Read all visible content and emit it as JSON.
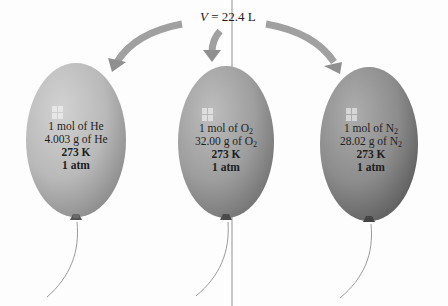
{
  "title": {
    "var": "V",
    "rest": " = 22.4 L"
  },
  "balloons": [
    {
      "gas": "He",
      "line1_prefix": "1 mol of He",
      "line1_sub": "",
      "line2_prefix": "4.003 g of He",
      "line2_sub": "",
      "temperature": "273 K",
      "pressure": "1 atm",
      "color": "#b9b9b9"
    },
    {
      "gas": "O2",
      "line1_prefix": "1 mol of O",
      "line1_sub": "2",
      "line2_prefix": "32.00 g of O",
      "line2_sub": "2",
      "temperature": "273 K",
      "pressure": "1 atm",
      "color": "#9e9e9e"
    },
    {
      "gas": "N2",
      "line1_prefix": "1 mol of N",
      "line1_sub": "2",
      "line2_prefix": "28.02 g of N",
      "line2_sub": "2",
      "temperature": "273 K",
      "pressure": "1 atm",
      "color": "#8c8c8c"
    }
  ]
}
